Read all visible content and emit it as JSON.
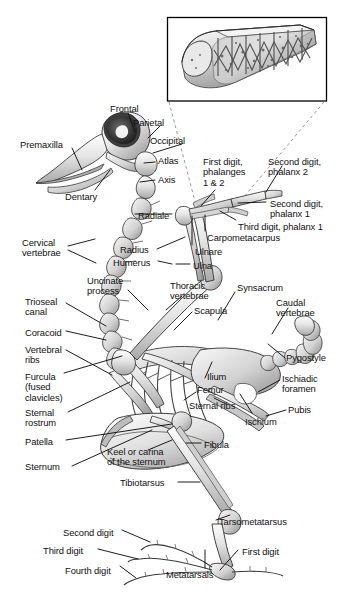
{
  "figure": {
    "background_color": "#ffffff",
    "ink_color": "#111111",
    "bone_fill_light": "#f2f2f2",
    "bone_fill_mid": "#cfcfcf",
    "bone_fill_dark": "#8d8d8d",
    "leader_line_color": "#111111",
    "inset": {
      "name": "pneumatic-bone-cutaway",
      "caption": "",
      "border_color": "#000000",
      "dashed_connector_color": "#8a8a8a"
    }
  },
  "labels": [
    {
      "id": "frontal",
      "text": "Frontal",
      "x": 110,
      "y": 104,
      "align": "left"
    },
    {
      "id": "parietal",
      "text": "Parietal",
      "x": 133,
      "y": 118,
      "align": "left"
    },
    {
      "id": "occipital",
      "text": "Occipital",
      "x": 150,
      "y": 136,
      "align": "left"
    },
    {
      "id": "premaxilla",
      "text": "Premaxilla",
      "x": 20,
      "y": 140,
      "align": "left"
    },
    {
      "id": "atlas",
      "text": "Atlas",
      "x": 158,
      "y": 156,
      "align": "left"
    },
    {
      "id": "axis",
      "text": "Axis",
      "x": 158,
      "y": 175,
      "align": "left"
    },
    {
      "id": "dentary",
      "text": "Dentary",
      "x": 65,
      "y": 192,
      "align": "left"
    },
    {
      "id": "first-digit-phalanges",
      "text": "First digit,\nphalanges\n1 & 2",
      "x": 203,
      "y": 157,
      "align": "left"
    },
    {
      "id": "second-digit-phalanx-2",
      "text": "Second digit,\nphalanx 2",
      "x": 268,
      "y": 157,
      "align": "left"
    },
    {
      "id": "second-digit-phalanx-1",
      "text": "Second digit,\nphalanx 1",
      "x": 270,
      "y": 199,
      "align": "left"
    },
    {
      "id": "third-digit-phalanx-1",
      "text": "Third digit, phalanx 1",
      "x": 238,
      "y": 222,
      "align": "left"
    },
    {
      "id": "radiale",
      "text": "Radiale",
      "x": 138,
      "y": 211,
      "align": "left"
    },
    {
      "id": "carpometacarpus",
      "text": "Carpometacarpus",
      "x": 207,
      "y": 233,
      "align": "left"
    },
    {
      "id": "ulnare",
      "text": "Ulnare",
      "x": 195,
      "y": 247,
      "align": "left"
    },
    {
      "id": "radius",
      "text": "Radius",
      "x": 120,
      "y": 245,
      "align": "left"
    },
    {
      "id": "humerus",
      "text": "Humerus",
      "x": 113,
      "y": 258,
      "align": "left"
    },
    {
      "id": "ulna",
      "text": "Ulna",
      "x": 193,
      "y": 261,
      "align": "left"
    },
    {
      "id": "cervical-vertebrae",
      "text": "Cervical\nvertebrae",
      "x": 22,
      "y": 238,
      "align": "left"
    },
    {
      "id": "uncinate-process",
      "text": "Uncinate\nprocess",
      "x": 87,
      "y": 276,
      "align": "left"
    },
    {
      "id": "thoracic-vertebrae",
      "text": "Thoracic\nvertebrae",
      "x": 170,
      "y": 281,
      "align": "left"
    },
    {
      "id": "synsacrum",
      "text": "Synsacrum",
      "x": 237,
      "y": 283,
      "align": "left"
    },
    {
      "id": "caudal-vertebrae",
      "text": "Caudal\nvertebrae",
      "x": 276,
      "y": 298,
      "align": "left"
    },
    {
      "id": "scapula",
      "text": "Scapula",
      "x": 194,
      "y": 306,
      "align": "left"
    },
    {
      "id": "trioseal-canal",
      "text": "Trioseal\ncanal",
      "x": 25,
      "y": 297,
      "align": "left"
    },
    {
      "id": "coracoid",
      "text": "Coracoid",
      "x": 25,
      "y": 328,
      "align": "left"
    },
    {
      "id": "vertebral-ribs",
      "text": "Vertebral\nribs",
      "x": 25,
      "y": 345,
      "align": "left"
    },
    {
      "id": "pygostyle",
      "text": "Pygostyle",
      "x": 286,
      "y": 353,
      "align": "left"
    },
    {
      "id": "furcula",
      "text": "Furcula\n(fused\nclavicles)",
      "x": 25,
      "y": 372,
      "align": "left"
    },
    {
      "id": "ilium",
      "text": "Ilium",
      "x": 207,
      "y": 372,
      "align": "left"
    },
    {
      "id": "femur",
      "text": "Femur",
      "x": 197,
      "y": 385,
      "align": "left"
    },
    {
      "id": "ischiadic-foramen",
      "text": "Ischiadic\nforamen",
      "x": 282,
      "y": 374,
      "align": "left"
    },
    {
      "id": "sternal-ribs",
      "text": "Sternal ribs",
      "x": 189,
      "y": 401,
      "align": "left"
    },
    {
      "id": "sternal-rostrum",
      "text": "Sternal\nrostrum",
      "x": 25,
      "y": 408,
      "align": "left"
    },
    {
      "id": "ischium",
      "text": "Ischium",
      "x": 245,
      "y": 417,
      "align": "left"
    },
    {
      "id": "pubis",
      "text": "Pubis",
      "x": 288,
      "y": 405,
      "align": "left"
    },
    {
      "id": "patella",
      "text": "Patella",
      "x": 25,
      "y": 437,
      "align": "left"
    },
    {
      "id": "fibula",
      "text": "Fibula",
      "x": 204,
      "y": 440,
      "align": "left"
    },
    {
      "id": "keel-or-carina",
      "text": "Keel or carina\nof the sternum",
      "x": 107,
      "y": 447,
      "align": "left"
    },
    {
      "id": "sternum",
      "text": "Sternum",
      "x": 25,
      "y": 462,
      "align": "left"
    },
    {
      "id": "tibiotarsus",
      "text": "Tibiotarsus",
      "x": 120,
      "y": 478,
      "align": "left"
    },
    {
      "id": "tarsometatarsus",
      "text": "Tarsometatarsus",
      "x": 219,
      "y": 517,
      "align": "left"
    },
    {
      "id": "second-digit",
      "text": "Second digit",
      "x": 63,
      "y": 528,
      "align": "left"
    },
    {
      "id": "third-digit",
      "text": "Third digit",
      "x": 43,
      "y": 546,
      "align": "left"
    },
    {
      "id": "first-digit",
      "text": "First digit",
      "x": 242,
      "y": 547,
      "align": "left"
    },
    {
      "id": "fourth-digit",
      "text": "Fourth digit",
      "x": 65,
      "y": 566,
      "align": "left"
    },
    {
      "id": "metatarsals",
      "text": "Metatarsals",
      "x": 166,
      "y": 570,
      "align": "left"
    }
  ]
}
